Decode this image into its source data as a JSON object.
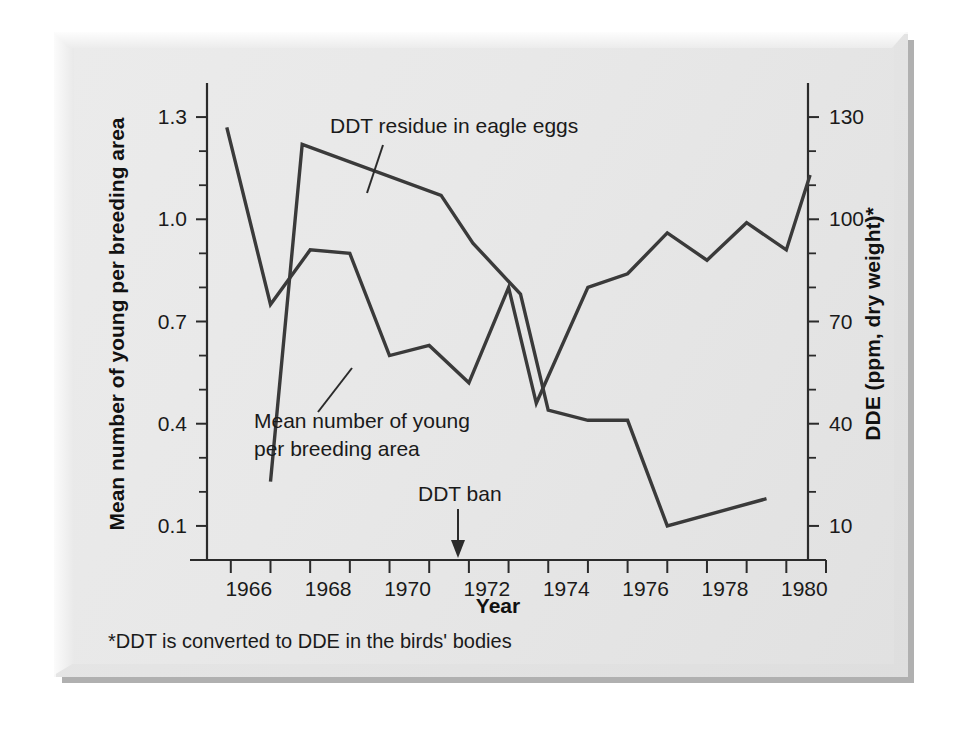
{
  "chart_data": {
    "type": "line",
    "title": "",
    "xlabel": "Year",
    "ylabel_left": "Mean number of young per breeding area",
    "ylabel_right": "DDE (ppm, dry weight)*",
    "footnote": "*DDT is converted to DDE in the birds' bodies",
    "grid": false,
    "legend_position": "inline-annotations",
    "xlim": [
      1965.4,
      1981.0
    ],
    "xticks": [
      1966,
      1967,
      1968,
      1969,
      1970,
      1971,
      1972,
      1973,
      1974,
      1975,
      1976,
      1977,
      1978,
      1979,
      1980,
      1981
    ],
    "xtick_labels": [
      "1966",
      "",
      "1968",
      "",
      "1970",
      "",
      "1972",
      "",
      "1974",
      "",
      "1976",
      "",
      "1978",
      "",
      "1980",
      ""
    ],
    "ylim_left": [
      0.0,
      1.4
    ],
    "yticks_left": [
      0.1,
      0.2,
      0.3,
      0.4,
      0.5,
      0.6,
      0.7,
      0.8,
      0.9,
      1.0,
      1.1,
      1.2,
      1.3
    ],
    "ytick_labels_left": [
      "0.1",
      "",
      "",
      "0.4",
      "",
      "",
      "0.7",
      "",
      "",
      "1.0",
      "",
      "",
      "1.3"
    ],
    "ylim_right": [
      0,
      140
    ],
    "yticks_right": [
      10,
      20,
      30,
      40,
      50,
      60,
      70,
      80,
      90,
      100,
      110,
      120,
      130
    ],
    "ytick_labels_right": [
      "10",
      "",
      "",
      "40",
      "",
      "",
      "70",
      "",
      "",
      "100",
      "",
      "",
      "130"
    ],
    "series": [
      {
        "name": "DDT residue in eagle eggs",
        "axis": "right",
        "unit": "ppm DDE, dry weight",
        "x": [
          1967.0,
          1967.8,
          1971.3,
          1972.1,
          1973.3,
          1974.0,
          1975.0,
          1976.0,
          1977.0,
          1979.5
        ],
        "values": [
          23,
          122,
          107,
          93,
          78,
          44,
          41,
          41,
          10,
          18
        ]
      },
      {
        "name": "Mean number of young per breeding area",
        "axis": "left",
        "unit": "young per breeding area",
        "x": [
          1965.9,
          1967.0,
          1968.0,
          1969.0,
          1970.0,
          1971.0,
          1972.0,
          1973.0,
          1973.7,
          1975.0,
          1976.0,
          1977.0,
          1978.0,
          1979.0,
          1980.0,
          1980.6
        ],
        "values": [
          1.27,
          0.75,
          0.91,
          0.9,
          0.6,
          0.63,
          0.52,
          0.8,
          0.46,
          0.8,
          0.84,
          0.96,
          0.88,
          0.99,
          0.91,
          1.13
        ]
      }
    ],
    "annotations": [
      {
        "name": "ddt-residue-label",
        "text": "DDT residue in eagle eggs",
        "leader": true
      },
      {
        "name": "mean-young-label",
        "line1": "Mean number of young",
        "line2": "per breeding area",
        "leader": true
      },
      {
        "name": "ddt-ban-marker",
        "text": "DDT ban",
        "x": 1972.5,
        "arrow": true
      }
    ],
    "colors": {
      "line": "#3a3a3a",
      "axis": "#2b2b2b",
      "panel": "#e8e8e8",
      "text": "#1a1a1a"
    }
  }
}
